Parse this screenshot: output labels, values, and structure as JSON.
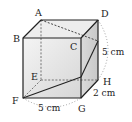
{
  "diagram": {
    "vertices": {
      "A": {
        "label": "A",
        "x": 41,
        "y": 20
      },
      "B": {
        "label": "B",
        "x": 23,
        "y": 38
      },
      "C": {
        "label": "C",
        "x": 81,
        "y": 38
      },
      "D": {
        "label": "D",
        "x": 98,
        "y": 20
      },
      "E": {
        "label": "E",
        "x": 41,
        "y": 80
      },
      "F": {
        "label": "F",
        "x": 23,
        "y": 98
      },
      "G": {
        "label": "G",
        "x": 81,
        "y": 98
      },
      "H": {
        "label": "H",
        "x": 98,
        "y": 80
      }
    },
    "dimensions": {
      "height": "5 cm",
      "depth": "2 cm",
      "width": "5 cm"
    },
    "path": {
      "points": [
        "A",
        "P on DH",
        "Q on CG",
        "F"
      ],
      "P": {
        "x": 98,
        "y": 41
      },
      "Q": {
        "x": 81,
        "y": 77
      }
    },
    "colors": {
      "edge": "#222222",
      "hidden_edge": "#555555",
      "front_face_top": "#f2f2f2",
      "front_face_bottom": "#d8d8d8",
      "right_face": "#d0d0d0",
      "top_face": "#ececec",
      "dotted_arc": "#888888"
    }
  }
}
